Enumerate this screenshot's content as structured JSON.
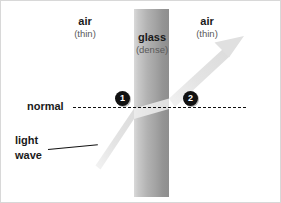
{
  "diagram": {
    "regions": [
      {
        "id": "air-left",
        "name": "air",
        "property": "(thin)"
      },
      {
        "id": "glass",
        "name": "glass",
        "property": "(dense)"
      },
      {
        "id": "air-right",
        "name": "air",
        "property": "(thin)"
      }
    ],
    "normal_label": "normal",
    "light_wave_label_line1": "light",
    "light_wave_label_line2": "wave",
    "markers": [
      {
        "id": "marker-1",
        "label": "1"
      },
      {
        "id": "marker-2",
        "label": "2"
      }
    ],
    "colors": {
      "background": "#ffffff",
      "text": "#1a1a1a",
      "subtext": "#5a5a5a",
      "normal_line": "#111111",
      "marker_fill": "#111111",
      "marker_text": "#ffffff",
      "beam": "#e2e2e2",
      "glass_light": "#d9d9d9",
      "glass_dark": "#8e8e8e",
      "border": "#d8d8d8"
    }
  }
}
